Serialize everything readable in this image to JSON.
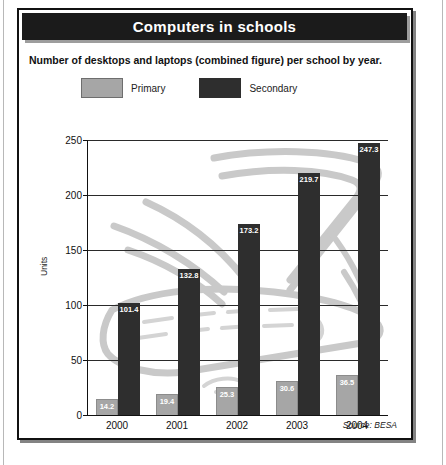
{
  "figure": {
    "title": "Computers in schools",
    "subtitle": "Number of desktops and laptops (combined figure) per school by year.",
    "source": "Source: BESA",
    "colors": {
      "primary": "#a6a6a6",
      "secondary": "#2e2e2e",
      "title_bar": "#1b1b1b",
      "frame": "#111111",
      "watermark": "#c9c9c9"
    }
  },
  "chart_data": {
    "type": "bar",
    "title": "Computers in schools",
    "subtitle": "Number of desktops and laptops (combined figure) per school by year.",
    "xlabel": "",
    "ylabel": "Units",
    "categories": [
      "2000",
      "2001",
      "2002",
      "2003",
      "2004"
    ],
    "series": [
      {
        "name": "Primary",
        "values": [
          14.2,
          19.4,
          25.3,
          30.6,
          36.5
        ]
      },
      {
        "name": "Secondary",
        "values": [
          101.4,
          132.8,
          173.2,
          219.7,
          247.3
        ]
      }
    ],
    "ylim": [
      0,
      250
    ],
    "yticks": [
      0,
      50,
      100,
      150,
      200,
      250
    ],
    "grid": true,
    "legend_position": "top-left",
    "annotation": "Source: BESA"
  }
}
